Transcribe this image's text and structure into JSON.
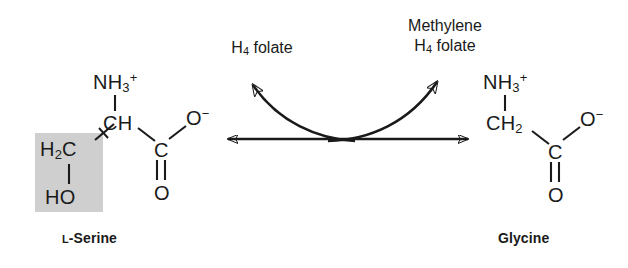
{
  "diagram": {
    "background_color": "#ffffff",
    "ink_color": "#1a1a1a",
    "highlight_color": "#cfcfcf"
  },
  "serine": {
    "caption_prefix": "L",
    "caption_rest": "-Serine",
    "amino": "NH",
    "amino_sub": "3",
    "amino_charge": "+",
    "alpha_carbon": "CH",
    "carboxyl_carbon": "C",
    "carbonyl_oxygen": "O",
    "carboxylate_oxygen": "O",
    "carboxylate_charge": "−",
    "side_chain_carbon": "H",
    "side_chain_carbon_sub": "2",
    "side_chain_carbon_rest": "C",
    "hydroxyl": "HO"
  },
  "glycine": {
    "caption": "Glycine",
    "amino": "NH",
    "amino_sub": "3",
    "amino_charge": "+",
    "alpha_carbon": "CH",
    "alpha_carbon_sub": "2",
    "carboxyl_carbon": "C",
    "carbonyl_oxygen": "O",
    "carboxylate_oxygen": "O",
    "carboxylate_charge": "−"
  },
  "reagents": {
    "left_line1": "H",
    "left_sub": "4",
    "left_rest": " folate",
    "right_line1": "Methylene",
    "right_line2_pre": "H",
    "right_line2_sub": "4",
    "right_line2_rest": " folate"
  },
  "arrows": {
    "equilibrium_label": "reversible reaction",
    "left_curve_label": "H4 folate consumed",
    "right_curve_label": "Methylene H4 folate produced"
  }
}
